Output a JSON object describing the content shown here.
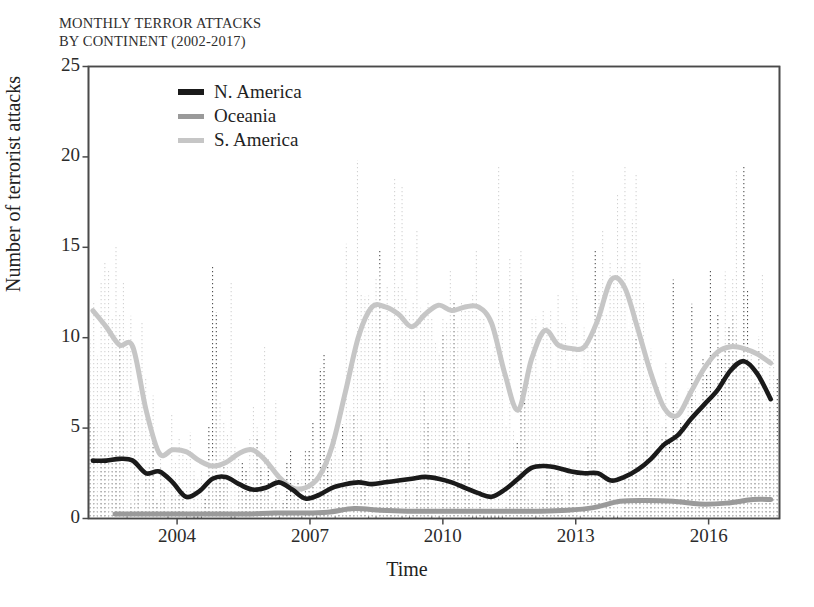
{
  "figure": {
    "title_line1": "MONTHLY TERROR ATTACKS",
    "title_line2": "BY CONTINENT (2002-2017)"
  },
  "chart_data": {
    "type": "line",
    "title": "MONTHLY TERROR ATTACKS BY CONTINENT (2002-2017)",
    "xlabel": "Time",
    "ylabel": "Number of terrorist attacks",
    "xlim": [
      2002.0,
      2017.6
    ],
    "ylim": [
      0,
      25
    ],
    "yticks": [
      0,
      5,
      10,
      15,
      20,
      25
    ],
    "ytick_labels": [
      "0",
      "5",
      "10",
      "15",
      "20",
      "25"
    ],
    "xticks": [
      2004,
      2007,
      2010,
      2013,
      2016
    ],
    "xtick_labels": [
      "2004",
      "2007",
      "2010",
      "2013",
      "2016"
    ],
    "grid": false,
    "legend_position": "top-left-inside",
    "legend": [
      "N. America",
      "Oceania",
      "S. America"
    ],
    "colors": {
      "n_america": "#1a1a1a",
      "oceania": "#9a9a9a",
      "s_america": "#c6c6c6",
      "axis": "#4a4a4a",
      "background": "#ffffff"
    },
    "series": [
      {
        "name": "N. America",
        "style": "solid-smooth",
        "color": "#1a1a1a",
        "x": [
          2002.1,
          2002.4,
          2002.7,
          2003.0,
          2003.3,
          2003.6,
          2003.9,
          2004.2,
          2004.5,
          2004.8,
          2005.1,
          2005.4,
          2005.7,
          2006.0,
          2006.3,
          2006.6,
          2006.9,
          2007.2,
          2007.5,
          2007.8,
          2008.1,
          2008.4,
          2008.7,
          2009.0,
          2009.3,
          2009.6,
          2009.9,
          2010.2,
          2010.5,
          2010.8,
          2011.1,
          2011.4,
          2011.7,
          2012.0,
          2012.3,
          2012.6,
          2012.9,
          2013.2,
          2013.5,
          2013.8,
          2014.1,
          2014.4,
          2014.7,
          2015.0,
          2015.3,
          2015.6,
          2015.9,
          2016.2,
          2016.5,
          2016.8,
          2017.1,
          2017.4
        ],
        "y": [
          3.2,
          3.2,
          3.3,
          3.2,
          2.5,
          2.6,
          2.0,
          1.2,
          1.5,
          2.2,
          2.3,
          1.9,
          1.6,
          1.7,
          2.0,
          1.6,
          1.1,
          1.3,
          1.7,
          1.9,
          2.0,
          1.9,
          2.0,
          2.1,
          2.2,
          2.3,
          2.2,
          2.0,
          1.7,
          1.4,
          1.2,
          1.6,
          2.2,
          2.8,
          2.9,
          2.8,
          2.6,
          2.5,
          2.5,
          2.1,
          2.3,
          2.7,
          3.3,
          4.1,
          4.6,
          5.5,
          6.3,
          7.1,
          8.2,
          8.7,
          8.0,
          6.6
        ]
      },
      {
        "name": "Oceania",
        "style": "solid-smooth",
        "color": "#9a9a9a",
        "x": [
          2002.6,
          2003.2,
          2003.8,
          2004.4,
          2005.0,
          2005.6,
          2006.2,
          2006.8,
          2007.4,
          2008.0,
          2008.6,
          2009.2,
          2009.8,
          2010.4,
          2011.0,
          2011.6,
          2012.2,
          2012.8,
          2013.4,
          2014.0,
          2014.6,
          2015.2,
          2015.8,
          2016.4,
          2017.0,
          2017.4
        ],
        "y": [
          0.25,
          0.25,
          0.25,
          0.25,
          0.25,
          0.25,
          0.3,
          0.3,
          0.35,
          0.55,
          0.45,
          0.4,
          0.4,
          0.4,
          0.4,
          0.4,
          0.4,
          0.45,
          0.6,
          0.95,
          1.0,
          0.95,
          0.8,
          0.85,
          1.05,
          1.05
        ]
      },
      {
        "name": "S. America",
        "style": "solid-smooth",
        "color": "#c6c6c6",
        "x": [
          2002.1,
          2002.4,
          2002.7,
          2003.0,
          2003.3,
          2003.6,
          2003.9,
          2004.2,
          2004.5,
          2004.8,
          2005.1,
          2005.4,
          2005.7,
          2006.0,
          2006.3,
          2006.6,
          2006.9,
          2007.2,
          2007.5,
          2007.8,
          2008.1,
          2008.4,
          2008.7,
          2009.0,
          2009.3,
          2009.6,
          2009.9,
          2010.2,
          2010.5,
          2010.8,
          2011.1,
          2011.4,
          2011.7,
          2012.0,
          2012.3,
          2012.6,
          2012.9,
          2013.2,
          2013.5,
          2013.8,
          2014.1,
          2014.4,
          2014.7,
          2015.0,
          2015.3,
          2015.6,
          2015.9,
          2016.2,
          2016.5,
          2016.8,
          2017.1,
          2017.4
        ],
        "y": [
          11.5,
          10.6,
          9.6,
          9.5,
          6.0,
          3.6,
          3.8,
          3.7,
          3.2,
          2.9,
          3.1,
          3.6,
          3.8,
          3.2,
          2.3,
          1.7,
          1.7,
          2.3,
          4.0,
          7.0,
          10.1,
          11.7,
          11.7,
          11.3,
          10.6,
          11.3,
          11.8,
          11.5,
          11.7,
          11.7,
          10.8,
          8.0,
          6.0,
          8.8,
          10.4,
          9.6,
          9.4,
          9.5,
          11.0,
          13.2,
          12.8,
          10.5,
          8.0,
          6.1,
          5.7,
          7.0,
          8.3,
          9.2,
          9.5,
          9.4,
          9.1,
          8.6
        ]
      }
    ],
    "raw_monthly_peaks": {
      "n_america_max": 22,
      "s_america_max": 20,
      "oceania_max": 4
    }
  }
}
